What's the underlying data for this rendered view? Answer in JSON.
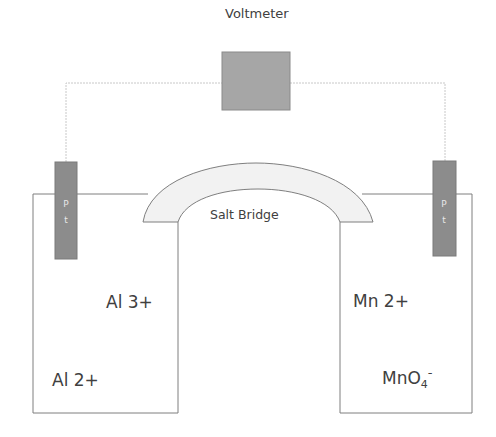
{
  "diagram": {
    "title": "Voltmeter",
    "salt_bridge_label": "Salt Bridge",
    "left_cell": {
      "electrode": {
        "line1": "P",
        "line2": "t"
      },
      "ions": [
        "Al 3+",
        "Al 2+"
      ]
    },
    "right_cell": {
      "electrode": {
        "line1": "P",
        "line2": "t"
      },
      "ions": [
        "Mn 2+",
        "MnO",
        "4",
        "-"
      ]
    },
    "colors": {
      "voltmeter": "#a6a6a6",
      "electrode": "#8c8c8c",
      "bridge_fill": "#f2f2f2",
      "outline": "#7f7f7f",
      "wire": "#c8c8c8",
      "text": "#404040"
    }
  }
}
